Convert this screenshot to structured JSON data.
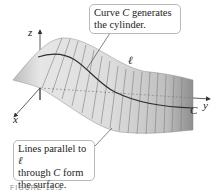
{
  "figure": {
    "type": "surface-diagram",
    "axes": {
      "x_label": "x",
      "y_label": "y",
      "z_label": "z"
    },
    "labels": {
      "curve": "C",
      "curve_near_axis": "C",
      "line": "ℓ"
    },
    "callouts": [
      {
        "id": "top",
        "line1_pre": "Curve ",
        "line1_var": "C",
        "line1_post": " generates",
        "line2": "the cylinder."
      },
      {
        "id": "bottom",
        "line1_pre": "Lines parallel to ",
        "line1_var": "ℓ",
        "line2_pre": "through ",
        "line2_var": "C",
        "line2_post": " form",
        "line3": "the surface."
      }
    ],
    "caption": "FIGURE 15.5",
    "colors": {
      "surface_light": "#e9e9e9",
      "surface_dark": "#9a9a9a",
      "rulings": "#7a7a7a",
      "curve": "#333333",
      "axes": "#333333",
      "callout_border": "#b9b9b9"
    }
  }
}
